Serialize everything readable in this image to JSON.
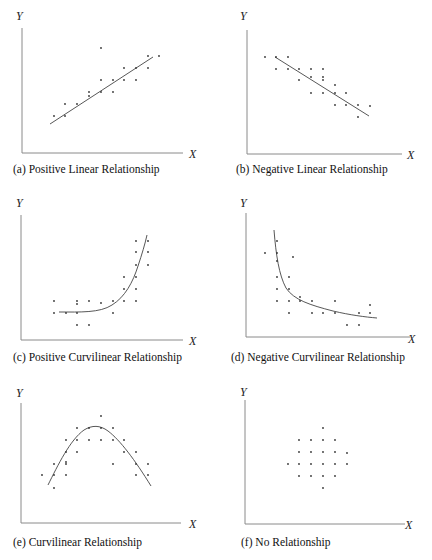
{
  "figure": {
    "panels": [
      {
        "id": "a",
        "caption": "(a) Positive Linear Relationship",
        "x_label": "X",
        "y_label": "Y",
        "origin": [
          22,
          153
        ],
        "y_top": 28,
        "x_right": 183,
        "y_label_pos": [
          16,
          20
        ],
        "x_label_pos": [
          189,
          158
        ],
        "caption_pos": [
          13,
          173
        ],
        "fit_type": "line",
        "fit_path": "M50,124 L153,57",
        "points": [
          [
            54,
            116
          ],
          [
            65,
            104
          ],
          [
            65,
            116
          ],
          [
            77,
            104
          ],
          [
            89,
            92
          ],
          [
            89,
            96
          ],
          [
            101,
            48
          ],
          [
            101,
            80
          ],
          [
            101,
            92
          ],
          [
            113,
            80
          ],
          [
            113,
            92
          ],
          [
            124,
            68
          ],
          [
            124,
            80
          ],
          [
            136,
            68
          ],
          [
            136,
            80
          ],
          [
            148,
            56
          ],
          [
            148,
            68
          ],
          [
            159,
            56
          ]
        ]
      },
      {
        "id": "b",
        "caption": "(b) Negative Linear Relationship",
        "x_label": "X",
        "y_label": "Y",
        "origin": [
          247,
          154
        ],
        "y_top": 30,
        "x_right": 402,
        "y_label_pos": [
          240,
          20
        ],
        "x_label_pos": [
          407,
          159
        ],
        "caption_pos": [
          236,
          173
        ],
        "fit_type": "line",
        "fit_path": "M275,57 L369,116",
        "points": [
          [
            265,
            57
          ],
          [
            276,
            57
          ],
          [
            288,
            57
          ],
          [
            276,
            69
          ],
          [
            288,
            69
          ],
          [
            299,
            69
          ],
          [
            311,
            69
          ],
          [
            323,
            69
          ],
          [
            299,
            80
          ],
          [
            311,
            77
          ],
          [
            323,
            77
          ],
          [
            323,
            80
          ],
          [
            311,
            93
          ],
          [
            323,
            93
          ],
          [
            335,
            85
          ],
          [
            335,
            93
          ],
          [
            346,
            93
          ],
          [
            335,
            105
          ],
          [
            346,
            105
          ],
          [
            358,
            105
          ],
          [
            370,
            106
          ],
          [
            358,
            117
          ]
        ]
      },
      {
        "id": "c",
        "caption": "(c) Positive Curvilinear Relationship",
        "x_label": "X",
        "y_label": "Y",
        "origin": [
          21,
          340
        ],
        "y_top": 215,
        "x_right": 183,
        "y_label_pos": [
          16,
          207
        ],
        "x_label_pos": [
          189,
          345
        ],
        "caption_pos": [
          13,
          361
        ],
        "fit_type": "curve",
        "fit_path": "M59,312 C80,312 100,313 112,305 C125,297 133,282 138,266 C142,254 145,244 147,235",
        "points": [
          [
            54,
            301
          ],
          [
            54,
            313
          ],
          [
            66,
            313
          ],
          [
            77,
            301
          ],
          [
            77,
            304
          ],
          [
            77,
            313
          ],
          [
            77,
            325
          ],
          [
            89,
            301
          ],
          [
            89,
            325
          ],
          [
            101,
            303
          ],
          [
            113,
            301
          ],
          [
            113,
            313
          ],
          [
            124,
            277
          ],
          [
            124,
            289
          ],
          [
            124,
            301
          ],
          [
            136,
            241
          ],
          [
            136,
            252
          ],
          [
            136,
            265
          ],
          [
            136,
            277
          ],
          [
            136,
            289
          ],
          [
            136,
            301
          ],
          [
            148,
            241
          ],
          [
            148,
            252
          ],
          [
            148,
            265
          ]
        ]
      },
      {
        "id": "d",
        "caption": "(d) Negative Curvilinear Relationship",
        "x_label": "X",
        "y_label": "Y",
        "origin": [
          246,
          337
        ],
        "y_top": 213,
        "x_right": 410,
        "y_label_pos": [
          240,
          207
        ],
        "x_label_pos": [
          408,
          343
        ],
        "caption_pos": [
          231,
          361
        ],
        "fit_type": "curve",
        "fit_path": "M274,230 C276,255 279,275 286,288 C294,300 310,305 333,311 C350,315 365,317 377,318",
        "points": [
          [
            265,
            253
          ],
          [
            277,
            241
          ],
          [
            277,
            253
          ],
          [
            277,
            261
          ],
          [
            277,
            277
          ],
          [
            277,
            289
          ],
          [
            277,
            301
          ],
          [
            289,
            277
          ],
          [
            289,
            289
          ],
          [
            289,
            301
          ],
          [
            289,
            313
          ],
          [
            293,
            257
          ],
          [
            300,
            297
          ],
          [
            300,
            301
          ],
          [
            312,
            301
          ],
          [
            312,
            313
          ],
          [
            323,
            313
          ],
          [
            335,
            301
          ],
          [
            335,
            313
          ],
          [
            347,
            325
          ],
          [
            359,
            313
          ],
          [
            359,
            325
          ],
          [
            370,
            305
          ],
          [
            370,
            313
          ]
        ]
      },
      {
        "id": "e",
        "caption": "(e) Curvilinear Relationship",
        "x_label": "X",
        "y_label": "Y",
        "origin": [
          21,
          523
        ],
        "y_top": 403,
        "x_right": 181,
        "y_label_pos": [
          16,
          397
        ],
        "x_label_pos": [
          189,
          528
        ],
        "caption_pos": [
          13,
          546
        ],
        "fit_type": "curve",
        "fit_path": "M48,485 C58,465 70,440 84,430 C92,425 100,425 108,431 C120,440 135,460 151,486",
        "points": [
          [
            42,
            475
          ],
          [
            54,
            464
          ],
          [
            54,
            475
          ],
          [
            54,
            488
          ],
          [
            66,
            440
          ],
          [
            66,
            452
          ],
          [
            66,
            462
          ],
          [
            66,
            464
          ],
          [
            66,
            475
          ],
          [
            77,
            428
          ],
          [
            77,
            440
          ],
          [
            77,
            452
          ],
          [
            89,
            428
          ],
          [
            89,
            440
          ],
          [
            101,
            416
          ],
          [
            101,
            428
          ],
          [
            101,
            440
          ],
          [
            113,
            428
          ],
          [
            113,
            440
          ],
          [
            113,
            464
          ],
          [
            124,
            440
          ],
          [
            124,
            452
          ],
          [
            136,
            452
          ],
          [
            136,
            464
          ],
          [
            136,
            475
          ],
          [
            148,
            464
          ],
          [
            148,
            475
          ]
        ]
      },
      {
        "id": "f",
        "caption": "(f) No Relationship",
        "x_label": "X",
        "y_label": "Y",
        "origin": [
          245,
          524
        ],
        "y_top": 400,
        "x_right": 405,
        "y_label_pos": [
          240,
          396
        ],
        "x_label_pos": [
          405,
          529
        ],
        "caption_pos": [
          241,
          546
        ],
        "fit_type": "none",
        "fit_path": "",
        "points": [
          [
            323,
            428
          ],
          [
            299,
            440
          ],
          [
            311,
            440
          ],
          [
            323,
            440
          ],
          [
            335,
            440
          ],
          [
            299,
            452
          ],
          [
            311,
            452
          ],
          [
            323,
            452
          ],
          [
            335,
            452
          ],
          [
            347,
            453
          ],
          [
            288,
            464
          ],
          [
            299,
            464
          ],
          [
            311,
            464
          ],
          [
            323,
            464
          ],
          [
            335,
            464
          ],
          [
            347,
            464
          ],
          [
            299,
            476
          ],
          [
            311,
            476
          ],
          [
            323,
            476
          ],
          [
            335,
            476
          ],
          [
            323,
            488
          ]
        ]
      }
    ]
  },
  "chart_data": [
    {
      "type": "scatter",
      "title": "(a) Positive Linear Relationship",
      "xlabel": "X",
      "ylabel": "Y",
      "trend": "linear increasing",
      "grid": false
    },
    {
      "type": "scatter",
      "title": "(b) Negative Linear Relationship",
      "xlabel": "X",
      "ylabel": "Y",
      "trend": "linear decreasing",
      "grid": false
    },
    {
      "type": "scatter",
      "title": "(c) Positive Curvilinear Relationship",
      "xlabel": "X",
      "ylabel": "Y",
      "trend": "exponential increasing",
      "grid": false
    },
    {
      "type": "scatter",
      "title": "(d) Negative Curvilinear Relationship",
      "xlabel": "X",
      "ylabel": "Y",
      "trend": "decaying",
      "grid": false
    },
    {
      "type": "scatter",
      "title": "(e) Curvilinear Relationship",
      "xlabel": "X",
      "ylabel": "Y",
      "trend": "inverted U",
      "grid": false
    },
    {
      "type": "scatter",
      "title": "(f) No Relationship",
      "xlabel": "X",
      "ylabel": "Y",
      "trend": "none",
      "grid": false
    }
  ]
}
